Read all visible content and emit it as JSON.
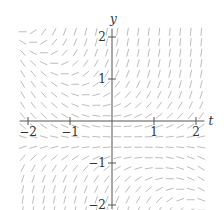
{
  "chart_data": {
    "type": "slope_field",
    "title": "",
    "xlabel": "t",
    "ylabel": "y",
    "xlim": [
      -2.2,
      2.2
    ],
    "ylim": [
      -2.1,
      2.2
    ],
    "x_ticks": [
      -2,
      -1,
      1,
      2
    ],
    "x_tick_labels": [
      "−2",
      "−1",
      "1",
      "2"
    ],
    "y_ticks": [
      2,
      1,
      -1,
      -2
    ],
    "y_tick_labels": [
      "2",
      "1",
      "−1",
      "−2"
    ],
    "grid": false,
    "legend": null,
    "slope_function": "dy/dt = (y + 0.5)(t + y)",
    "sample_spacing": 0.25,
    "sample_t_range": [
      -2.125,
      2.125
    ],
    "sample_y_range": [
      -2.125,
      2.125
    ],
    "nullclines": [
      "y = -0.5",
      "y = -t"
    ],
    "segment_color": "#bdbdbd",
    "axis_color": "#555555"
  },
  "geometry": {
    "origin_px": [
      112,
      121
    ],
    "unit_px": 42,
    "segment_len_px": 8
  }
}
